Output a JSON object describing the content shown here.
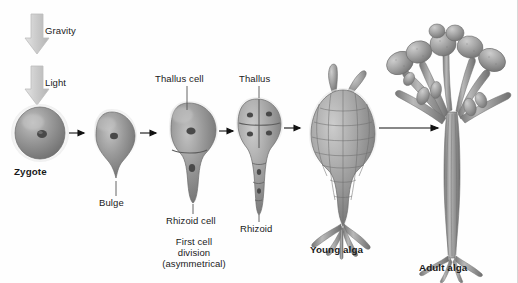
{
  "figure": {
    "background_color": "#fefefe",
    "ink_color": "#1a1a1a",
    "organism_color": "#8e8e8e",
    "block_arrow_color": "#c9c9c9"
  },
  "environment_arrows": [
    {
      "id": "gravity",
      "label": "Gravity",
      "direction": "down"
    },
    {
      "id": "light",
      "label": "Light",
      "direction": "down"
    }
  ],
  "stages": [
    {
      "id": "zygote",
      "label": "Zygote",
      "bold": true,
      "label_position": "below",
      "description": "spherical single cell with central nucleus"
    },
    {
      "id": "bulge",
      "label": "Bulge",
      "bold": false,
      "label_position": "below-leader",
      "description": "teardrop cell with protrusion forming at base"
    },
    {
      "id": "thallus-cell",
      "label": "Thallus cell",
      "bold": false,
      "label_position": "above-leader",
      "secondary_label": "Rhizoid cell",
      "caption": "First cell division\n(asymmetrical)",
      "description": "two-celled stage divided asymmetrically"
    },
    {
      "id": "thallus",
      "label": "Thallus",
      "bold": false,
      "label_position": "above-leader",
      "secondary_label": "Rhizoid",
      "description": "four thallus cells above an elongating rhizoid"
    },
    {
      "id": "young-alga",
      "label": "Young alga",
      "bold": true,
      "label_position": "below",
      "description": "multicellular bulb with branched holdfast"
    },
    {
      "id": "adult-alga",
      "label": "Adult alga",
      "bold": true,
      "label_position": "below",
      "description": "branched thallus with club-shaped receptacles"
    }
  ],
  "captions": {
    "first_division_line1": "First cell",
    "first_division_line2": "division",
    "first_division_line3": "(asymmetrical)",
    "rhizoid_cell": "Rhizoid cell",
    "rhizoid": "Rhizoid",
    "thallus_cell": "Thallus cell",
    "thallus": "Thallus"
  }
}
